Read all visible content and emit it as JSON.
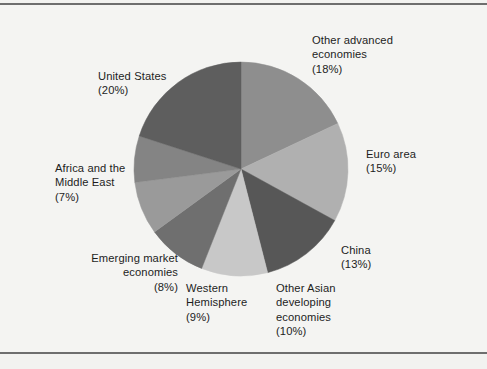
{
  "figure": {
    "background_color": "#f4f4f2",
    "frame_color": "#6e6e6e"
  },
  "chart_data": {
    "type": "pie",
    "title": "",
    "subtitle": "",
    "xlabel": "",
    "ylabel": "",
    "legend_position": "outside-labels",
    "grid": false,
    "units": "percent",
    "total": 100,
    "start_angle_deg": 0,
    "direction": "clockwise",
    "categories": [
      "Other advanced economies",
      "Euro area",
      "China",
      "Other Asian developing economies",
      "Western Hemisphere",
      "Emerging market economies",
      "Africa and the Middle East",
      "United States"
    ],
    "values": [
      18,
      15,
      13,
      10,
      9,
      8,
      7,
      20
    ],
    "colors": [
      "#8e8e8e",
      "#b0b0b0",
      "#575757",
      "#c8c8c8",
      "#6f6f6f",
      "#9a9a9a",
      "#848484",
      "#5e5e5e"
    ],
    "slices": [
      {
        "label": "Other advanced economies",
        "value": 18,
        "value_text": "(18%)",
        "color": "#8e8e8e"
      },
      {
        "label": "Euro area",
        "value": 15,
        "value_text": "(15%)",
        "color": "#b0b0b0"
      },
      {
        "label": "China",
        "value": 13,
        "value_text": "(13%)",
        "color": "#575757"
      },
      {
        "label": "Other Asian developing economies",
        "value": 10,
        "value_text": "(10%)",
        "color": "#c8c8c8"
      },
      {
        "label": "Western Hemisphere",
        "value": 9,
        "value_text": "(9%)",
        "color": "#6f6f6f"
      },
      {
        "label": "Emerging market economies",
        "value": 8,
        "value_text": "(8%)",
        "color": "#9a9a9a"
      },
      {
        "label": "Africa and the Middle East",
        "value": 7,
        "value_text": "(7%)",
        "color": "#848484"
      },
      {
        "label": "United States",
        "value": 20,
        "value_text": "(20%)",
        "color": "#5e5e5e"
      }
    ]
  },
  "labels": {
    "other_advanced": "Other advanced\neconomies\n(18%)",
    "euro_area": "Euro area\n(15%)",
    "china": "China\n(13%)",
    "other_asian": "Other Asian\ndeveloping\neconomies\n(10%)",
    "western_hemisphere": "Western\nHemisphere\n(9%)",
    "emerging_market": "Emerging market\neconomies\n(8%)",
    "africa_middle_east": "Africa and the\nMiddle East\n(7%)",
    "united_states": "United States\n(20%)"
  }
}
